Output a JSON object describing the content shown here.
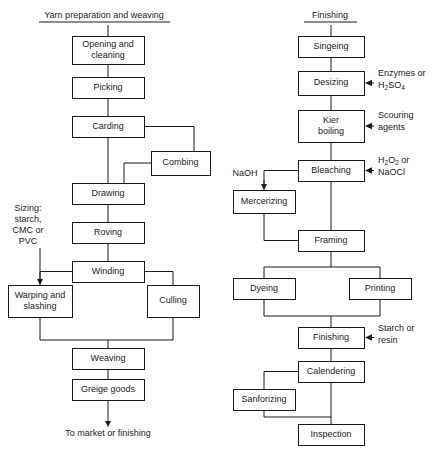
{
  "figure": {
    "type": "flowchart",
    "orientation": "two-column",
    "background_color": "#ffffff",
    "line_color": "#1a1a1a",
    "box_fill": "#ffffff"
  },
  "columns": [
    {
      "id": "left",
      "title": "Yarn preparation and weaving",
      "title_x": 104,
      "title_y": 18,
      "rule": {
        "x1": 39,
        "x2": 170,
        "y": 22
      }
    },
    {
      "id": "right",
      "title": "Finishing",
      "title_x": 330,
      "title_y": 18,
      "rule": {
        "x1": 304,
        "x2": 357,
        "y": 22
      }
    }
  ],
  "nodes": [
    {
      "id": "opening",
      "label": "Opening and cleaning",
      "lines": [
        "Opening and",
        "cleaning"
      ],
      "x": 72,
      "y": 36,
      "w": 72,
      "h": 28,
      "column": "left"
    },
    {
      "id": "picking",
      "label": "Picking",
      "lines": [
        "Picking"
      ],
      "x": 72,
      "y": 77,
      "w": 72,
      "h": 21,
      "column": "left"
    },
    {
      "id": "carding",
      "label": "Carding",
      "lines": [
        "Carding"
      ],
      "x": 72,
      "y": 116,
      "w": 72,
      "h": 21,
      "column": "left"
    },
    {
      "id": "combing",
      "label": "Combing",
      "lines": [
        "Combing"
      ],
      "x": 151,
      "y": 151,
      "w": 59,
      "h": 24,
      "column": "left"
    },
    {
      "id": "drawing",
      "label": "Drawing",
      "lines": [
        "Drawing"
      ],
      "x": 72,
      "y": 183,
      "w": 72,
      "h": 21,
      "column": "left"
    },
    {
      "id": "roving",
      "label": "Roving",
      "lines": [
        "Roving"
      ],
      "x": 72,
      "y": 222,
      "w": 72,
      "h": 21,
      "column": "left"
    },
    {
      "id": "winding",
      "label": "Winding",
      "lines": [
        "Winding"
      ],
      "x": 72,
      "y": 261,
      "w": 72,
      "h": 21,
      "column": "left"
    },
    {
      "id": "warping",
      "label": "Warping and slashing",
      "lines": [
        "Warping and",
        "slashing"
      ],
      "x": 8,
      "y": 285,
      "w": 64,
      "h": 32,
      "column": "left"
    },
    {
      "id": "culling",
      "label": "Culling",
      "lines": [
        "Culling"
      ],
      "x": 147,
      "y": 285,
      "w": 52,
      "h": 32,
      "column": "left"
    },
    {
      "id": "weaving",
      "label": "Weaving",
      "lines": [
        "Weaving"
      ],
      "x": 72,
      "y": 348,
      "w": 72,
      "h": 21,
      "column": "left"
    },
    {
      "id": "greige",
      "label": "Greige goods",
      "lines": [
        "Greige goods"
      ],
      "x": 72,
      "y": 379,
      "w": 72,
      "h": 21,
      "column": "left"
    },
    {
      "id": "singeing",
      "label": "Singeing",
      "lines": [
        "Singeing"
      ],
      "x": 298,
      "y": 36,
      "w": 66,
      "h": 21,
      "column": "right"
    },
    {
      "id": "desizing",
      "label": "Desizing",
      "lines": [
        "Desizing"
      ],
      "x": 298,
      "y": 71,
      "w": 66,
      "h": 24,
      "column": "right"
    },
    {
      "id": "kier",
      "label": "Kier boiling",
      "lines": [
        "Kier",
        "boiling"
      ],
      "x": 298,
      "y": 110,
      "w": 66,
      "h": 32,
      "column": "right"
    },
    {
      "id": "bleaching",
      "label": "Bleaching",
      "lines": [
        "Bleaching"
      ],
      "x": 298,
      "y": 160,
      "w": 66,
      "h": 21,
      "column": "right"
    },
    {
      "id": "mercerizing",
      "label": "Mercerizing",
      "lines": [
        "Mercerizing"
      ],
      "x": 233,
      "y": 190,
      "w": 62,
      "h": 23,
      "column": "right"
    },
    {
      "id": "framing",
      "label": "Framing",
      "lines": [
        "Framing"
      ],
      "x": 298,
      "y": 230,
      "w": 66,
      "h": 21,
      "column": "right"
    },
    {
      "id": "dyeing",
      "label": "Dyeing",
      "lines": [
        "Dyeing"
      ],
      "x": 233,
      "y": 278,
      "w": 62,
      "h": 21,
      "column": "right"
    },
    {
      "id": "printing",
      "label": "Printing",
      "lines": [
        "Printing"
      ],
      "x": 349,
      "y": 278,
      "w": 62,
      "h": 21,
      "column": "right"
    },
    {
      "id": "finishing",
      "label": "Finishing",
      "lines": [
        "Finishing"
      ],
      "x": 298,
      "y": 327,
      "w": 66,
      "h": 21,
      "column": "right"
    },
    {
      "id": "calendering",
      "label": "Calendering",
      "lines": [
        "Calendering"
      ],
      "x": 298,
      "y": 361,
      "w": 66,
      "h": 21,
      "column": "right"
    },
    {
      "id": "sanforizing",
      "label": "Sanforizing",
      "lines": [
        "Sanforizing"
      ],
      "x": 233,
      "y": 389,
      "w": 62,
      "h": 21,
      "column": "right"
    },
    {
      "id": "inspection",
      "label": "Inspection",
      "lines": [
        "Inspection"
      ],
      "x": 298,
      "y": 424,
      "w": 66,
      "h": 21,
      "column": "right"
    }
  ],
  "annotations": [
    {
      "id": "sizing",
      "lines": [
        "Sizing:",
        "starch,",
        "CMC or",
        "PVC"
      ],
      "x": 28,
      "y": 211,
      "line_height": 11,
      "align": "middle",
      "target": "warping",
      "arrow": "down"
    },
    {
      "id": "enzymes",
      "lines": [
        "Enzymes or",
        "H2SO4"
      ],
      "rich": [
        {
          "text": "Enzymes or"
        },
        {
          "base": "H",
          "sub1": "2",
          "mid": "SO",
          "sub2": "4"
        }
      ],
      "x": 378,
      "y": 76,
      "line_height": 12,
      "align": "start",
      "target": "desizing",
      "arrow": "left"
    },
    {
      "id": "scouring",
      "lines": [
        "Scouring",
        "agents"
      ],
      "x": 378,
      "y": 118,
      "line_height": 12,
      "align": "start",
      "target": "kier",
      "arrow": "left"
    },
    {
      "id": "peroxide",
      "lines": [
        "H2O2 or",
        "NaOCl"
      ],
      "rich": [
        {
          "base": "H",
          "sub1": "2",
          "mid": "O",
          "sub2": "2",
          "tail": " or"
        },
        {
          "text": "NaOCl"
        }
      ],
      "x": 378,
      "y": 163,
      "line_height": 12,
      "align": "start",
      "target": "bleaching",
      "arrow": "left"
    },
    {
      "id": "naoh",
      "lines": [
        "NaOH"
      ],
      "x": 245,
      "y": 176,
      "line_height": 11,
      "align": "middle",
      "target": "mercerizing",
      "arrow": "down"
    },
    {
      "id": "starch-resin",
      "lines": [
        "Starch or",
        "resin"
      ],
      "x": 378,
      "y": 331,
      "line_height": 12,
      "align": "start",
      "target": "finishing",
      "arrow": "left"
    }
  ],
  "terminal": {
    "id": "to-market",
    "text": "To market or finishing",
    "x": 108,
    "y": 436
  },
  "edges": [
    {
      "id": "title-to-opening",
      "from": "left-title",
      "to": "opening",
      "kind": "straight"
    },
    {
      "id": "opening-picking",
      "from": "opening",
      "to": "picking",
      "kind": "straight"
    },
    {
      "id": "picking-carding",
      "from": "picking",
      "to": "carding",
      "kind": "straight"
    },
    {
      "id": "carding-drawing",
      "from": "carding",
      "to": "drawing",
      "kind": "straight"
    },
    {
      "id": "carding-combing",
      "from": "carding",
      "to": "combing",
      "kind": "elbow-right"
    },
    {
      "id": "combing-drawing",
      "from": "combing",
      "to": "drawing",
      "kind": "elbow-right"
    },
    {
      "id": "drawing-roving",
      "from": "drawing",
      "to": "roving",
      "kind": "straight"
    },
    {
      "id": "roving-winding",
      "from": "roving",
      "to": "winding",
      "kind": "straight"
    },
    {
      "id": "winding-warping",
      "from": "winding",
      "to": "warping",
      "kind": "elbow-left"
    },
    {
      "id": "winding-culling",
      "from": "winding",
      "to": "culling",
      "kind": "elbow-right"
    },
    {
      "id": "warping-weaving",
      "from": "warping",
      "to": "weaving",
      "kind": "merge"
    },
    {
      "id": "culling-weaving",
      "from": "culling",
      "to": "weaving",
      "kind": "merge"
    },
    {
      "id": "weaving-greige",
      "from": "weaving",
      "to": "greige",
      "kind": "straight"
    },
    {
      "id": "greige-market",
      "from": "greige",
      "to": "to-market",
      "kind": "arrow-down"
    },
    {
      "id": "title-to-singeing",
      "from": "right-title",
      "to": "singeing",
      "kind": "straight"
    },
    {
      "id": "singeing-desizing",
      "from": "singeing",
      "to": "desizing",
      "kind": "straight"
    },
    {
      "id": "desizing-kier",
      "from": "desizing",
      "to": "kier",
      "kind": "straight"
    },
    {
      "id": "kier-bleaching",
      "from": "kier",
      "to": "bleaching",
      "kind": "straight"
    },
    {
      "id": "bleaching-mercerizing",
      "from": "bleaching",
      "to": "mercerizing",
      "kind": "elbow-left"
    },
    {
      "id": "bleaching-framing",
      "from": "bleaching",
      "to": "framing",
      "kind": "straight"
    },
    {
      "id": "mercerizing-framing",
      "from": "mercerizing",
      "to": "framing",
      "kind": "elbow-left"
    },
    {
      "id": "framing-dyeing",
      "from": "framing",
      "to": "dyeing",
      "kind": "split-left"
    },
    {
      "id": "framing-printing",
      "from": "framing",
      "to": "printing",
      "kind": "split-right"
    },
    {
      "id": "dyeing-finishing",
      "from": "dyeing",
      "to": "finishing",
      "kind": "merge"
    },
    {
      "id": "printing-finishing",
      "from": "printing",
      "to": "finishing",
      "kind": "merge"
    },
    {
      "id": "finishing-calendering",
      "from": "finishing",
      "to": "calendering",
      "kind": "straight"
    },
    {
      "id": "calendering-sanforizing",
      "from": "calendering",
      "to": "sanforizing",
      "kind": "elbow-left"
    },
    {
      "id": "calendering-inspection",
      "from": "calendering",
      "to": "inspection",
      "kind": "straight"
    },
    {
      "id": "sanforizing-inspection",
      "from": "sanforizing",
      "to": "inspection",
      "kind": "elbow-left"
    }
  ]
}
